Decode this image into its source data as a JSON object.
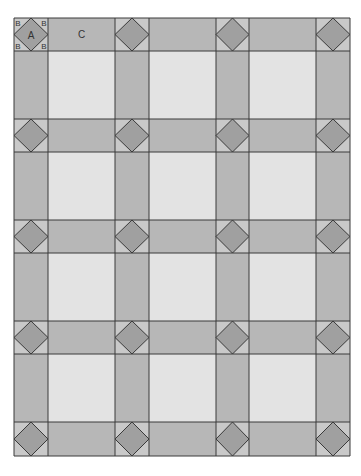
{
  "diagram": {
    "title": "",
    "labels": {
      "diamond": "A",
      "corner_triangle": "B",
      "sashing": "C"
    },
    "grid": {
      "cols": [
        14,
        48,
        115,
        149,
        216,
        249,
        316,
        350
      ],
      "rows": [
        18,
        51,
        119,
        152,
        220,
        253,
        321,
        354,
        422,
        456
      ]
    },
    "colors": {
      "line": "#3a3a3a",
      "sashing": "#b7b7b7",
      "block": "#e3e3e3",
      "cornerstone": "#c9c9c9",
      "diamond": "#a0a0a0",
      "label": "#333333"
    }
  }
}
